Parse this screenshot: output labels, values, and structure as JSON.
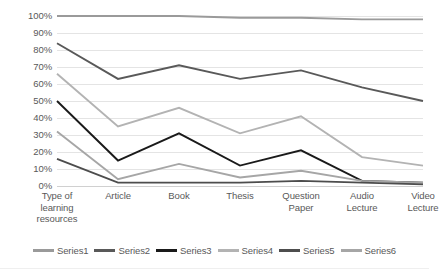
{
  "chart_data": {
    "type": "line",
    "title": "",
    "subtitle": "",
    "xlabel": "",
    "ylabel": "",
    "ylim": [
      0,
      100
    ],
    "y_unit": "%",
    "grid": true,
    "legend_position": "bottom",
    "categories": [
      "Type of learning resources",
      "Article",
      "Book",
      "Thesis",
      "Question Paper",
      "Audio Lecture",
      "Video Lecture"
    ],
    "category_lines": [
      [
        "Type of",
        "learning",
        "resources"
      ],
      [
        "Article"
      ],
      [
        "Book"
      ],
      [
        "Thesis"
      ],
      [
        "Question",
        "Paper"
      ],
      [
        "Audio",
        "Lecture"
      ],
      [
        "Video",
        "Lecture"
      ]
    ],
    "y_ticks": [
      "0%",
      "10%",
      "20%",
      "30%",
      "40%",
      "50%",
      "60%",
      "70%",
      "80%",
      "90%",
      "100%"
    ],
    "y_tick_values": [
      0,
      10,
      20,
      30,
      40,
      50,
      60,
      70,
      80,
      90,
      100
    ],
    "series": [
      {
        "name": "Series1",
        "color": "#9a9a9a",
        "values": [
          100,
          100,
          100,
          99,
          99,
          98,
          98
        ]
      },
      {
        "name": "Series2",
        "color": "#595959",
        "values": [
          84,
          63,
          71,
          63,
          68,
          58,
          50
        ]
      },
      {
        "name": "Series3",
        "color": "#1a1a1a",
        "values": [
          50,
          15,
          31,
          12,
          21,
          3,
          2
        ]
      },
      {
        "name": "Series4",
        "color": "#b3b3b3",
        "values": [
          66,
          35,
          46,
          31,
          41,
          17,
          12
        ]
      },
      {
        "name": "Series5",
        "color": "#4d4d4d",
        "values": [
          16,
          2,
          2,
          2,
          3,
          2,
          1
        ]
      },
      {
        "name": "Series6",
        "color": "#a6a6a6",
        "values": [
          32,
          4,
          13,
          5,
          9,
          3,
          2
        ]
      }
    ]
  },
  "legend": {
    "items": [
      {
        "label": "Series1"
      },
      {
        "label": "Series2"
      },
      {
        "label": "Series3"
      },
      {
        "label": "Series4"
      },
      {
        "label": "Series5"
      },
      {
        "label": "Series6"
      }
    ]
  }
}
